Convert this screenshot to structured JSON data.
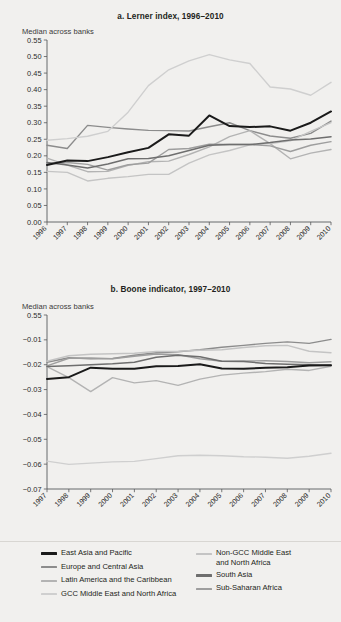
{
  "figure": {
    "background_color": "#f1f0ee",
    "axis_color": "#58595b"
  },
  "panel_a": {
    "title": "a.  Lerner index, 1996–2010",
    "axis_note": "Median across banks"
  },
  "panel_b": {
    "title": "b.  Boone indicator, 1997–2010",
    "axis_note": "Median across banks"
  },
  "legend": {
    "left": [
      {
        "label": "East Asia and Pacific",
        "color": "#1a1a1a",
        "thick": true
      },
      {
        "label": "Europe and Central Asia",
        "color": "#8c8c8c",
        "thick": false
      },
      {
        "label": "Latin America and the Caribbean",
        "color": "#b3b3b3",
        "thick": false
      },
      {
        "label": "GCC Middle East and North Africa",
        "color": "#cfcfcf",
        "thick": false
      }
    ],
    "right": [
      {
        "label": "Non-GCC Middle East\nand North Africa",
        "color": "#c4c4c4",
        "thick": false
      },
      {
        "label": "South Asia",
        "color": "#6e6e6e",
        "thick": true
      },
      {
        "label": "Sub-Saharan Africa",
        "color": "#9e9e9e",
        "thick": false
      }
    ]
  },
  "chart_data": [
    {
      "id": "lerner-index",
      "type": "line",
      "title": "a.  Lerner index, 1996–2010",
      "xlabel": "",
      "ylabel": "Median across banks",
      "grid": false,
      "legend_position": "below-figure",
      "x": [
        1996,
        1997,
        1998,
        1999,
        2000,
        2001,
        2002,
        2003,
        2004,
        2005,
        2006,
        2007,
        2008,
        2009,
        2010
      ],
      "xticklabels": [
        "1996",
        "1997",
        "1998",
        "1999",
        "2000",
        "2001",
        "2002",
        "2003",
        "2004",
        "2005",
        "2006",
        "2007",
        "2008",
        "2009",
        "2010"
      ],
      "ylim": [
        0.0,
        0.55
      ],
      "yticks": [
        0.0,
        0.05,
        0.1,
        0.15,
        0.2,
        0.25,
        0.3,
        0.35,
        0.4,
        0.45,
        0.5,
        0.55
      ],
      "yticklabels": [
        "0.00",
        "0.05",
        "0.10",
        "0.15",
        "0.20",
        "0.25",
        "0.30",
        "0.35",
        "0.40",
        "0.45",
        "0.50",
        "0.55"
      ],
      "series": [
        {
          "name": "East Asia and Pacific",
          "color": "#1a1a1a",
          "width": 2.0,
          "values": [
            0.172,
            0.186,
            0.184,
            0.196,
            0.211,
            0.224,
            0.265,
            0.261,
            0.322,
            0.29,
            0.287,
            0.289,
            0.276,
            0.3,
            0.334
          ]
        },
        {
          "name": "Europe and Central Asia",
          "color": "#8c8c8c",
          "width": 1.4,
          "values": [
            0.232,
            0.222,
            0.292,
            0.286,
            0.281,
            0.277,
            0.276,
            0.275,
            0.288,
            0.3,
            0.276,
            0.26,
            0.253,
            0.268,
            0.305
          ]
        },
        {
          "name": "Latin America and the Caribbean",
          "color": "#b3b3b3",
          "width": 1.4,
          "values": [
            0.193,
            0.172,
            0.152,
            0.153,
            0.171,
            0.182,
            0.184,
            0.204,
            0.227,
            0.258,
            0.276,
            0.237,
            0.191,
            0.208,
            0.219
          ]
        },
        {
          "name": "GCC Middle East and North Africa",
          "color": "#cfcfcf",
          "width": 1.4,
          "values": [
            0.247,
            0.252,
            0.259,
            0.274,
            0.332,
            0.412,
            0.46,
            0.487,
            0.506,
            0.49,
            0.479,
            0.408,
            0.402,
            0.383,
            0.422
          ]
        },
        {
          "name": "Non-GCC Middle East and North Africa",
          "color": "#c4c4c4",
          "width": 1.4,
          "values": [
            0.153,
            0.15,
            0.124,
            0.132,
            0.137,
            0.144,
            0.144,
            0.178,
            0.203,
            0.216,
            0.233,
            0.237,
            0.245,
            0.274,
            0.3
          ]
        },
        {
          "name": "South Asia",
          "color": "#6e6e6e",
          "width": 1.5,
          "values": [
            0.18,
            0.172,
            0.163,
            0.175,
            0.191,
            0.192,
            0.2,
            0.216,
            0.232,
            0.234,
            0.234,
            0.24,
            0.248,
            0.251,
            0.258
          ]
        },
        {
          "name": "Sub-Saharan Africa",
          "color": "#9e9e9e",
          "width": 1.4,
          "values": [
            0.176,
            0.18,
            0.174,
            0.157,
            0.173,
            0.178,
            0.219,
            0.222,
            0.235,
            0.234,
            0.234,
            0.23,
            0.213,
            0.232,
            0.243
          ]
        }
      ]
    },
    {
      "id": "boone-indicator",
      "type": "line",
      "title": "b.  Boone indicator, 1997–2010",
      "xlabel": "",
      "ylabel": "Median across banks",
      "grid": false,
      "legend_position": "below-figure",
      "x": [
        1997,
        1998,
        1999,
        2000,
        2001,
        2002,
        2003,
        2004,
        2005,
        2006,
        2007,
        2008,
        2009,
        2010
      ],
      "xticklabels": [
        "1997",
        "1998",
        "1999",
        "2000",
        "2001",
        "2002",
        "2003",
        "2004",
        "2005",
        "2006",
        "2007",
        "2008",
        "2009",
        "2010"
      ],
      "ylim": [
        -0.07,
        0.0
      ],
      "yticks": [
        -0.07,
        -0.06,
        -0.05,
        -0.04,
        -0.03,
        -0.02,
        -0.01,
        0.0
      ],
      "yticklabels": [
        "−0.07",
        "−0.06",
        "−0.05",
        "−0.04",
        "−0.03",
        "−0.02",
        "−0.01",
        "0.55"
      ],
      "top_tick_label": "0.55",
      "series": [
        {
          "name": "East Asia and Pacific",
          "color": "#1a1a1a",
          "width": 2.0,
          "values": [
            -0.0257,
            -0.025,
            -0.0212,
            -0.0216,
            -0.0216,
            -0.0206,
            -0.0205,
            -0.0198,
            -0.0215,
            -0.0216,
            -0.0212,
            -0.021,
            -0.0203,
            -0.0202
          ]
        },
        {
          "name": "Europe and Central Asia",
          "color": "#8c8c8c",
          "width": 1.4,
          "values": [
            -0.019,
            -0.0172,
            -0.0176,
            -0.0175,
            -0.0162,
            -0.0152,
            -0.0148,
            -0.014,
            -0.013,
            -0.0122,
            -0.0114,
            -0.0108,
            -0.0114,
            -0.0098
          ]
        },
        {
          "name": "Latin America and the Caribbean",
          "color": "#b3b3b3",
          "width": 1.4,
          "values": [
            -0.0208,
            -0.0252,
            -0.0308,
            -0.0252,
            -0.0273,
            -0.0264,
            -0.0283,
            -0.0258,
            -0.0242,
            -0.0234,
            -0.0228,
            -0.0218,
            -0.0223,
            -0.0206
          ]
        },
        {
          "name": "GCC Middle East and North Africa",
          "color": "#cfcfcf",
          "width": 1.4,
          "values": [
            -0.0588,
            -0.0601,
            -0.0596,
            -0.0591,
            -0.0589,
            -0.0578,
            -0.0566,
            -0.0564,
            -0.0566,
            -0.057,
            -0.0572,
            -0.0576,
            -0.0568,
            -0.0556
          ]
        },
        {
          "name": "Non-GCC Middle East and North Africa",
          "color": "#c4c4c4",
          "width": 1.4,
          "values": [
            -0.0186,
            -0.0164,
            -0.0158,
            -0.0156,
            -0.0154,
            -0.0147,
            -0.0146,
            -0.0142,
            -0.014,
            -0.0131,
            -0.0124,
            -0.0122,
            -0.0146,
            -0.0152
          ]
        },
        {
          "name": "South Asia",
          "color": "#6e6e6e",
          "width": 1.5,
          "values": [
            -0.0207,
            -0.0204,
            -0.02,
            -0.0196,
            -0.019,
            -0.017,
            -0.0162,
            -0.0168,
            -0.0186,
            -0.0187,
            -0.0195,
            -0.0198,
            -0.02,
            -0.0202
          ]
        },
        {
          "name": "Sub-Saharan Africa",
          "color": "#9e9e9e",
          "width": 1.4,
          "values": [
            -0.0205,
            -0.0174,
            -0.0173,
            -0.0176,
            -0.0166,
            -0.0157,
            -0.016,
            -0.0176,
            -0.0186,
            -0.0185,
            -0.0184,
            -0.0187,
            -0.0192,
            -0.0188
          ]
        }
      ]
    }
  ]
}
